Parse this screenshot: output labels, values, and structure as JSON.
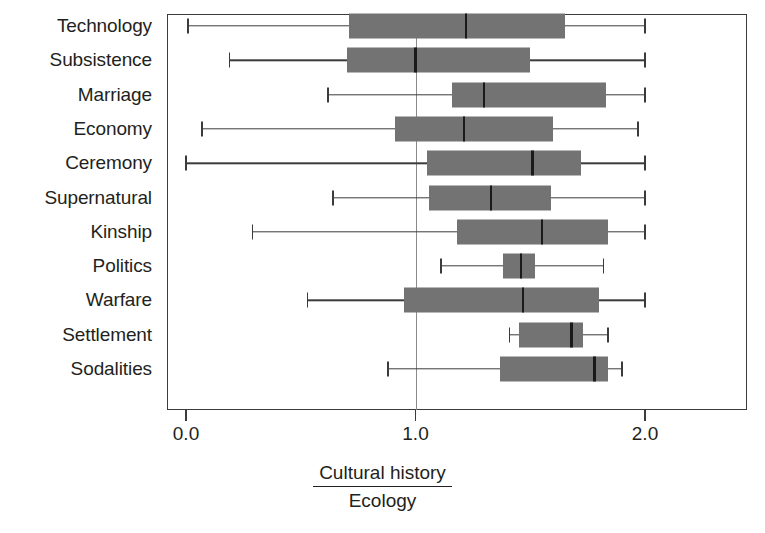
{
  "chart_data": {
    "type": "boxplot",
    "title": "",
    "xlabel_numerator": "Cultural history",
    "xlabel_denominator": "Ecology",
    "xlabel": "Cultural history / Ecology",
    "ylabel": "",
    "xlim": [
      -0.08,
      2.44
    ],
    "xticks": [
      0.0,
      1.0,
      2.0
    ],
    "xticklabels": [
      "0.0",
      "1.0",
      "2.0"
    ],
    "grid": false,
    "reference_line": 1.0,
    "legend": "none",
    "box_color": "#737373",
    "line_color": "#3b3b3b",
    "categories": [
      "Technology",
      "Subsistence",
      "Marriage",
      "Economy",
      "Ceremony",
      "Supernatural",
      "Kinship",
      "Politics",
      "Warfare",
      "Settlement",
      "Sodalities"
    ],
    "boxes": [
      {
        "category": "Technology",
        "whisker_low": 0.01,
        "q1": 0.71,
        "median": 1.22,
        "q3": 1.65,
        "whisker_high": 2.0
      },
      {
        "category": "Subsistence",
        "whisker_low": 0.19,
        "q1": 0.7,
        "median": 1.0,
        "q3": 1.5,
        "whisker_high": 2.0
      },
      {
        "category": "Marriage",
        "whisker_low": 0.62,
        "q1": 1.16,
        "median": 1.3,
        "q3": 1.83,
        "whisker_high": 2.0
      },
      {
        "category": "Economy",
        "whisker_low": 0.07,
        "q1": 0.91,
        "median": 1.21,
        "q3": 1.6,
        "whisker_high": 1.97
      },
      {
        "category": "Ceremony",
        "whisker_low": 0.0,
        "q1": 1.05,
        "median": 1.51,
        "q3": 1.72,
        "whisker_high": 2.0
      },
      {
        "category": "Supernatural",
        "whisker_low": 0.64,
        "q1": 1.06,
        "median": 1.33,
        "q3": 1.59,
        "whisker_high": 2.0
      },
      {
        "category": "Kinship",
        "whisker_low": 0.29,
        "q1": 1.18,
        "median": 1.55,
        "q3": 1.84,
        "whisker_high": 2.0
      },
      {
        "category": "Politics",
        "whisker_low": 1.11,
        "q1": 1.38,
        "median": 1.46,
        "q3": 1.52,
        "whisker_high": 1.82
      },
      {
        "category": "Warfare",
        "whisker_low": 0.53,
        "q1": 0.95,
        "median": 1.47,
        "q3": 1.8,
        "whisker_high": 2.0
      },
      {
        "category": "Settlement",
        "whisker_low": 1.41,
        "q1": 1.45,
        "median": 1.68,
        "q3": 1.73,
        "whisker_high": 1.84
      },
      {
        "category": "Sodalities",
        "whisker_low": 0.88,
        "q1": 1.37,
        "median": 1.78,
        "q3": 1.84,
        "whisker_high": 1.9
      }
    ]
  }
}
